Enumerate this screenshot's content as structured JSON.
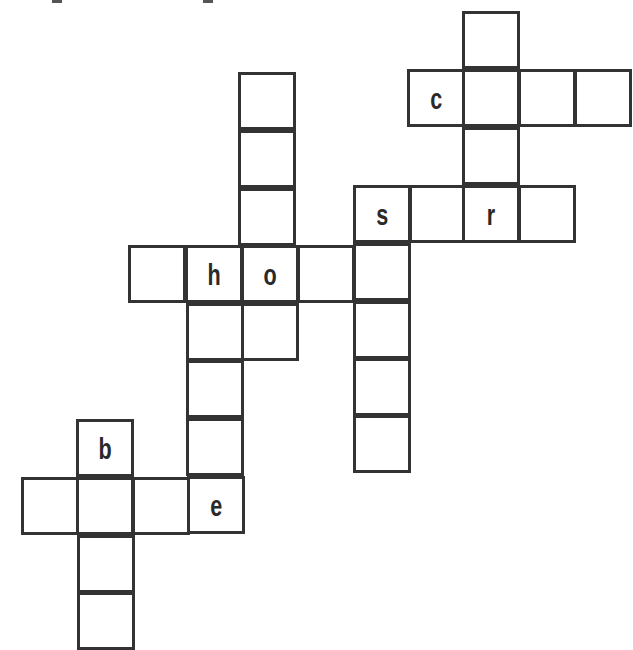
{
  "puzzle": {
    "type": "crossword",
    "cell_size": 57,
    "border_color": "#333333",
    "cells": [
      {
        "x": 462,
        "y": 11,
        "letter": ""
      },
      {
        "x": 407,
        "y": 69,
        "letter": "c"
      },
      {
        "x": 462,
        "y": 69,
        "letter": ""
      },
      {
        "x": 518,
        "y": 69,
        "letter": ""
      },
      {
        "x": 574,
        "y": 69,
        "letter": ""
      },
      {
        "x": 462,
        "y": 127,
        "letter": ""
      },
      {
        "x": 353,
        "y": 185,
        "letter": "s"
      },
      {
        "x": 409,
        "y": 185,
        "letter": ""
      },
      {
        "x": 462,
        "y": 185,
        "letter": "r"
      },
      {
        "x": 518,
        "y": 185,
        "letter": ""
      },
      {
        "x": 238,
        "y": 72,
        "letter": ""
      },
      {
        "x": 238,
        "y": 130,
        "letter": ""
      },
      {
        "x": 238,
        "y": 188,
        "letter": ""
      },
      {
        "x": 128,
        "y": 245,
        "letter": ""
      },
      {
        "x": 185,
        "y": 245,
        "letter": "h"
      },
      {
        "x": 241,
        "y": 245,
        "letter": "o"
      },
      {
        "x": 297,
        "y": 245,
        "letter": ""
      },
      {
        "x": 353,
        "y": 243,
        "letter": ""
      },
      {
        "x": 186,
        "y": 303,
        "letter": ""
      },
      {
        "x": 241,
        "y": 303,
        "letter": ""
      },
      {
        "x": 353,
        "y": 301,
        "letter": ""
      },
      {
        "x": 186,
        "y": 360,
        "letter": ""
      },
      {
        "x": 353,
        "y": 358,
        "letter": ""
      },
      {
        "x": 186,
        "y": 418,
        "letter": ""
      },
      {
        "x": 353,
        "y": 415,
        "letter": ""
      },
      {
        "x": 76,
        "y": 419,
        "letter": "b"
      },
      {
        "x": 21,
        "y": 477,
        "letter": ""
      },
      {
        "x": 76,
        "y": 477,
        "letter": ""
      },
      {
        "x": 132,
        "y": 477,
        "letter": ""
      },
      {
        "x": 187,
        "y": 476,
        "letter": "e"
      },
      {
        "x": 77,
        "y": 535,
        "letter": ""
      },
      {
        "x": 77,
        "y": 592,
        "letter": ""
      }
    ]
  }
}
